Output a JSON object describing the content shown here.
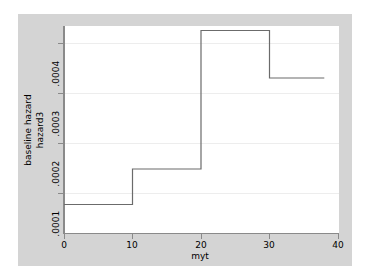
{
  "chart_data": {
    "type": "line",
    "subtype": "step-post",
    "title": "",
    "xlabel": "myt",
    "ylabel_lines": [
      "baseline hazard",
      "hazard3"
    ],
    "xlim": [
      0,
      40
    ],
    "ylim": [
      5e-05,
      0.000445
    ],
    "xticks": [
      0,
      10,
      20,
      30,
      40
    ],
    "xtick_labels": [
      "0",
      "10",
      "20",
      "30",
      "40"
    ],
    "yticks": [
      0.0001,
      0.0002,
      0.0003,
      0.0004
    ],
    "ytick_labels": [
      ".0001",
      ".0002",
      ".0003",
      ".0004"
    ],
    "grid": "horizontal",
    "legend": "none",
    "series": [
      {
        "name": "hazard3",
        "step_edges": [
          0,
          10,
          20,
          30,
          38
        ],
        "values": [
          7.7e-05,
          0.000148,
          0.000425,
          0.00033
        ]
      }
    ],
    "points": [
      {
        "x": 0,
        "y": 7.7e-05
      },
      {
        "x": 10,
        "y": 7.7e-05
      },
      {
        "x": 10,
        "y": 0.000148
      },
      {
        "x": 20,
        "y": 0.000148
      },
      {
        "x": 20,
        "y": 0.000425
      },
      {
        "x": 30,
        "y": 0.000425
      },
      {
        "x": 30,
        "y": 0.00033
      },
      {
        "x": 38,
        "y": 0.00033
      }
    ],
    "line_color": "#6b6b6b",
    "grid_color": "#ededed",
    "plot_bg": "#ffffff",
    "graph_bg": "#d4d4d4",
    "axis_color": "#8a8a8a"
  },
  "axis": {
    "x_title": "myt",
    "y_title_outer": "baseline hazard",
    "y_title_inner": "hazard3",
    "x_labels": [
      "0",
      "10",
      "20",
      "30",
      "40"
    ],
    "y_labels": [
      ".0001",
      ".0002",
      ".0003",
      ".0004"
    ]
  }
}
